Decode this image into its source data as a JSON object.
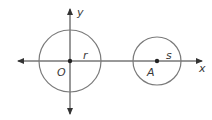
{
  "diagram": {
    "axes": {
      "x_label": "x",
      "y_label": "y"
    },
    "circles": [
      {
        "center_label": "O",
        "radius_label": "r"
      },
      {
        "center_label": "A",
        "radius_label": "s"
      }
    ],
    "colors": {
      "circle": "#7a7a7a",
      "axis": "#333333"
    }
  }
}
